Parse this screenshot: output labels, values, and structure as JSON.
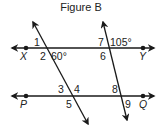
{
  "figure": {
    "title": "Figure B",
    "lines": [
      {
        "name": "XY",
        "points": [
          "X",
          "Y"
        ]
      },
      {
        "name": "PQ",
        "points": [
          "P",
          "Q"
        ]
      }
    ],
    "transversals": 2,
    "points": {
      "X": "X",
      "Y": "Y",
      "P": "P",
      "Q": "Q"
    },
    "angles": {
      "a1": "1",
      "a2": "2",
      "a60": "60°",
      "a7": "7",
      "a105": "105°",
      "a6": "6",
      "a3": "3",
      "a4": "4",
      "a5": "5",
      "a8": "8",
      "a9": "9"
    },
    "colors": {
      "stroke": "#1a1a1a",
      "text": "#222222",
      "background": "#ffffff"
    }
  }
}
